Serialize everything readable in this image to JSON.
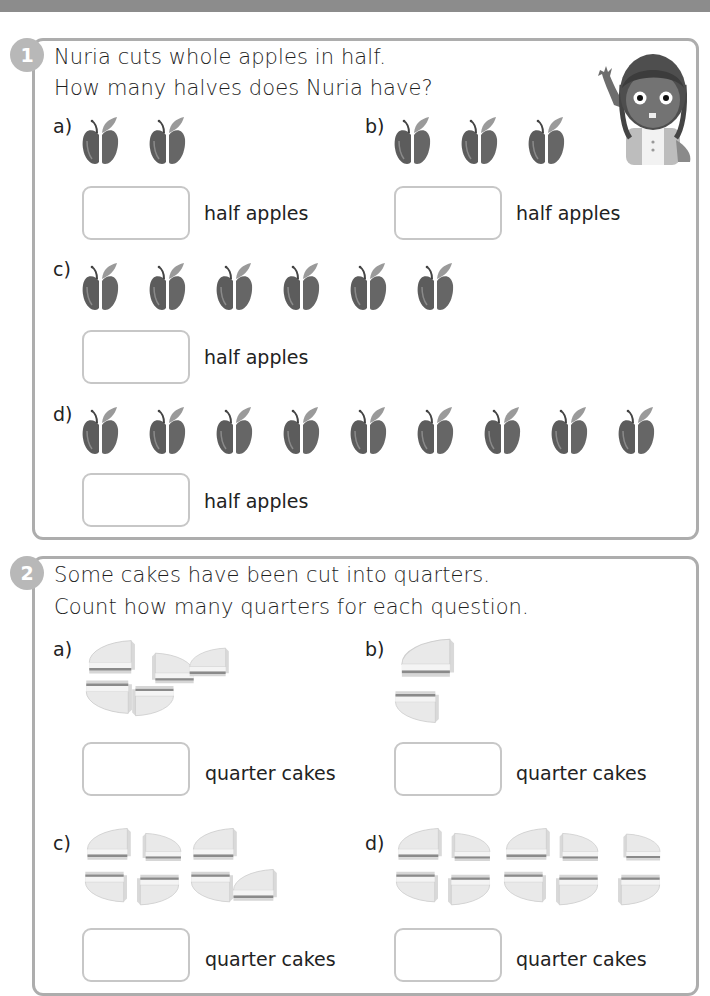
{
  "question1": {
    "number": "1",
    "line1": "Nuria cuts whole apples in half.",
    "line2": "How many halves does Nuria have?",
    "character": "girl-character-waving",
    "parts": [
      {
        "label": "a)",
        "apples": 2,
        "unit": "half apples",
        "answer": ""
      },
      {
        "label": "b)",
        "apples": 3,
        "unit": "half apples",
        "answer": ""
      },
      {
        "label": "c)",
        "apples": 6,
        "unit": "half apples",
        "answer": ""
      },
      {
        "label": "d)",
        "apples": 9,
        "unit": "half apples",
        "answer": ""
      }
    ]
  },
  "question2": {
    "number": "2",
    "line1": "Some cakes have been cut into quarters.",
    "line2": "Count how many quarters for each question.",
    "parts": [
      {
        "label": "a)",
        "quarters": 5,
        "unit": "quarter cakes",
        "answer": ""
      },
      {
        "label": "b)",
        "quarters": 2,
        "unit": "quarter cakes",
        "answer": ""
      },
      {
        "label": "c)",
        "quarters": 6,
        "unit": "quarter cakes",
        "answer": ""
      },
      {
        "label": "d)",
        "quarters": 10,
        "unit": "quarter cakes",
        "answer": ""
      }
    ]
  },
  "colors": {
    "panel_border": "#adadad",
    "badge": "#b8b8b8",
    "apple": "#5f5f5f",
    "answer_border": "#c7c7c7"
  }
}
